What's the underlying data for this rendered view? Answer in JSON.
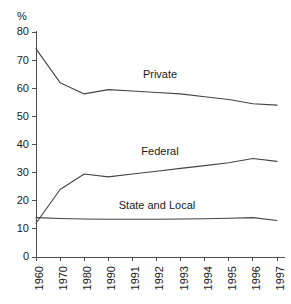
{
  "chart_data": {
    "type": "line",
    "title": "",
    "subtitle": "",
    "xlabel": "",
    "ylabel": "%",
    "yunit": "%",
    "categories": [
      "1960",
      "1970",
      "1980",
      "1990",
      "1991",
      "1992",
      "1993",
      "1994",
      "1995",
      "1996",
      "1997"
    ],
    "ylim": [
      0,
      80
    ],
    "yticks": [
      0,
      10,
      20,
      30,
      40,
      50,
      60,
      70,
      80
    ],
    "ytick_labels": [
      "0",
      "10",
      "20",
      "30",
      "40",
      "50",
      "60",
      "70",
      "80"
    ],
    "grid": false,
    "legend": "inline-annotations",
    "series": [
      {
        "name": "Private",
        "label": "Private",
        "color": "#444444",
        "values": [
          74,
          62,
          58,
          59.5,
          59,
          58.5,
          58,
          57,
          56,
          54.5,
          54
        ]
      },
      {
        "name": "Federal",
        "label": "Federal",
        "color": "#444444",
        "values": [
          12,
          24,
          29.5,
          28.5,
          29.5,
          30.5,
          31.5,
          32.5,
          33.5,
          35,
          34
        ]
      },
      {
        "name": "State and Local",
        "label": "State and Local",
        "color": "#444444",
        "values": [
          14,
          13.7,
          13.5,
          13.4,
          13.4,
          13.4,
          13.5,
          13.6,
          13.8,
          14,
          13
        ]
      }
    ],
    "annotations": [
      {
        "text": "Private",
        "series": "Private",
        "x_px": 160,
        "y_px": 78
      },
      {
        "text": "Federal",
        "series": "Federal",
        "x_px": 160,
        "y_px": 155
      },
      {
        "text": "State and Local",
        "series": "State and Local",
        "x_px": 157,
        "y_px": 209
      }
    ]
  }
}
